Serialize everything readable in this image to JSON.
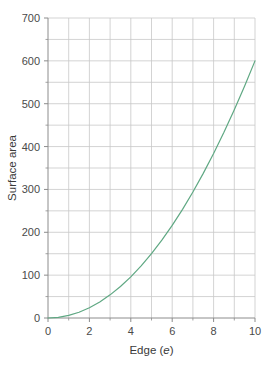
{
  "chart_data": {
    "type": "line",
    "title": "",
    "xlabel": "Edge (e)",
    "xlabel_plain": "Edge (",
    "xlabel_italic": "e",
    "xlabel_close": ")",
    "ylabel": "Surface area",
    "xlim": [
      0,
      10
    ],
    "ylim": [
      0,
      700
    ],
    "x_major_ticks": [
      0,
      2,
      4,
      6,
      8,
      10
    ],
    "x_major_tick_labels": [
      "0",
      "2",
      "4",
      "6",
      "8",
      "10"
    ],
    "x_minor_ticks": [
      1,
      3,
      5,
      7,
      9
    ],
    "x_gridlines": [
      1,
      2,
      3,
      4,
      5,
      6,
      7,
      8,
      9,
      10
    ],
    "y_major_ticks": [
      0,
      100,
      200,
      300,
      400,
      500,
      600,
      700
    ],
    "y_major_tick_labels": [
      "0",
      "100",
      "200",
      "300",
      "400",
      "500",
      "600",
      "700"
    ],
    "y_minor_ticks": [
      50,
      150,
      250,
      350,
      450,
      550,
      650
    ],
    "y_gridlines": [
      50,
      100,
      150,
      200,
      250,
      300,
      350,
      400,
      450,
      500,
      550,
      600,
      650,
      700
    ],
    "grid": true,
    "legend": "none",
    "series": [
      {
        "name": "Surface area of cube (6e²)",
        "color": "#5fa883",
        "line_width": 1.2,
        "x": [
          0,
          0.5,
          1,
          1.5,
          2,
          2.5,
          3,
          3.5,
          4,
          4.5,
          5,
          5.5,
          6,
          6.5,
          7,
          7.5,
          8,
          8.5,
          9,
          9.5,
          10
        ],
        "values": [
          0,
          1.5,
          6,
          13.5,
          24,
          37.5,
          54,
          73.5,
          96,
          121.5,
          150,
          181.5,
          216,
          253.5,
          294,
          337.5,
          384,
          433.5,
          486,
          541.5,
          600
        ]
      }
    ],
    "colors": {
      "curve": "#5fa883",
      "grid": "#c8c8c8",
      "axis": "#8c8c8c",
      "text": "#3a3a3a",
      "background": "#ffffff"
    },
    "geometry": {
      "plot_left": 48,
      "plot_right": 255,
      "plot_top": 18,
      "plot_bottom": 318
    }
  }
}
